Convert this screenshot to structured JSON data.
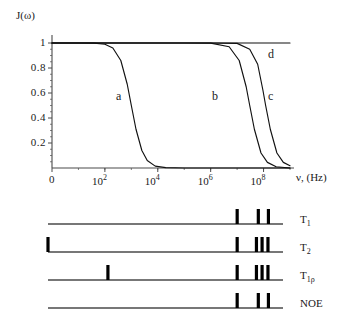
{
  "figure": {
    "title": "",
    "panels": [
      "spectral-density-plot",
      "relaxation-timescale-bars"
    ]
  },
  "chart_data": {
    "type": "line",
    "title": "",
    "xlabel": "ν, (Hz)",
    "ylabel": "J(ω)",
    "xscale": "log",
    "xlim": [
      1,
      1000000000
    ],
    "ylim": [
      0,
      1.05
    ],
    "grid": false,
    "legend": "inline-curve-labels",
    "ytick_labels": [
      "1",
      "0.8",
      "0.6",
      "0.4",
      "0.2"
    ],
    "ytick_values": [
      1,
      0.8,
      0.6,
      0.4,
      0.2
    ],
    "xtick_labels": [
      "0",
      "10",
      "10",
      "10",
      "10"
    ],
    "xtick_exponents": [
      "",
      "2",
      "4",
      "6",
      "8"
    ],
    "xtick_values": [
      0,
      100,
      10000,
      1000000,
      100000000
    ],
    "series": [
      {
        "name": "a",
        "label": "a",
        "correlation_time_hz": 1000,
        "description": "slow motion, lowest cutoff frequency",
        "points": [
          [
            1,
            1.0
          ],
          [
            10,
            1.0
          ],
          [
            40,
            0.999
          ],
          [
            100,
            0.99
          ],
          [
            200,
            0.96
          ],
          [
            400,
            0.86
          ],
          [
            700,
            0.67
          ],
          [
            1000,
            0.5
          ],
          [
            1500,
            0.31
          ],
          [
            2500,
            0.14
          ],
          [
            4000,
            0.06
          ],
          [
            8000,
            0.015
          ],
          [
            20000,
            0.003
          ],
          [
            100000,
            0.0
          ],
          [
            1000000000,
            0.0
          ]
        ]
      },
      {
        "name": "b",
        "label": "b",
        "correlation_time_hz": 30000000,
        "description": "intermediate motion",
        "points": [
          [
            1,
            1.0
          ],
          [
            100000,
            1.0
          ],
          [
            1000000,
            0.999
          ],
          [
            5000000,
            0.97
          ],
          [
            12000000,
            0.86
          ],
          [
            22000000,
            0.65
          ],
          [
            30000000,
            0.5
          ],
          [
            45000000,
            0.31
          ],
          [
            80000000,
            0.12
          ],
          [
            140000000,
            0.045
          ],
          [
            300000000,
            0.01
          ],
          [
            1000000000,
            0.0
          ]
        ]
      },
      {
        "name": "c",
        "label": "c",
        "correlation_time_hz": 120000000,
        "description": "fast motion",
        "points": [
          [
            1,
            1.0
          ],
          [
            1000000,
            1.0
          ],
          [
            10000000,
            0.997
          ],
          [
            30000000,
            0.95
          ],
          [
            60000000,
            0.83
          ],
          [
            95000000,
            0.62
          ],
          [
            120000000,
            0.5
          ],
          [
            180000000,
            0.31
          ],
          [
            320000000,
            0.12
          ],
          [
            560000000,
            0.045
          ],
          [
            1000000000,
            0.018
          ]
        ]
      },
      {
        "name": "d",
        "label": "d",
        "correlation_time_hz": null,
        "description": "extreme narrowing limit, flat at J=1",
        "points": [
          [
            1,
            1.0
          ],
          [
            1000000000,
            1.0
          ]
        ]
      }
    ]
  },
  "timescale_panel": {
    "rows": [
      {
        "id": "T1",
        "label": "T",
        "label_sub": "1",
        "marker_count": 3,
        "markers": [
          {
            "freq_pos": 0.805,
            "height": 15
          },
          {
            "freq_pos": 0.895,
            "height": 15
          },
          {
            "freq_pos": 0.938,
            "height": 15
          }
        ]
      },
      {
        "id": "T2",
        "label": "T",
        "label_sub": "2",
        "marker_count": 5,
        "markers": [
          {
            "freq_pos": 0.0,
            "height": 15
          },
          {
            "freq_pos": 0.805,
            "height": 15
          },
          {
            "freq_pos": 0.887,
            "height": 15
          },
          {
            "freq_pos": 0.911,
            "height": 15
          },
          {
            "freq_pos": 0.936,
            "height": 15
          }
        ]
      },
      {
        "id": "T1rho",
        "label": "T",
        "label_sub": "1ρ",
        "marker_count": 5,
        "markers": [
          {
            "freq_pos": 0.255,
            "height": 15
          },
          {
            "freq_pos": 0.805,
            "height": 15
          },
          {
            "freq_pos": 0.887,
            "height": 15
          },
          {
            "freq_pos": 0.911,
            "height": 15
          },
          {
            "freq_pos": 0.936,
            "height": 15
          }
        ]
      },
      {
        "id": "NOE",
        "label": "NOE",
        "label_sub": "",
        "marker_count": 3,
        "markers": [
          {
            "freq_pos": 0.805,
            "height": 15
          },
          {
            "freq_pos": 0.895,
            "height": 15
          },
          {
            "freq_pos": 0.938,
            "height": 15
          }
        ]
      }
    ]
  },
  "colors": {
    "ink": "#1a1a1a",
    "axis": "#4a4a4a",
    "curve": "#111111",
    "marker": "#000000",
    "background": "#ffffff"
  }
}
